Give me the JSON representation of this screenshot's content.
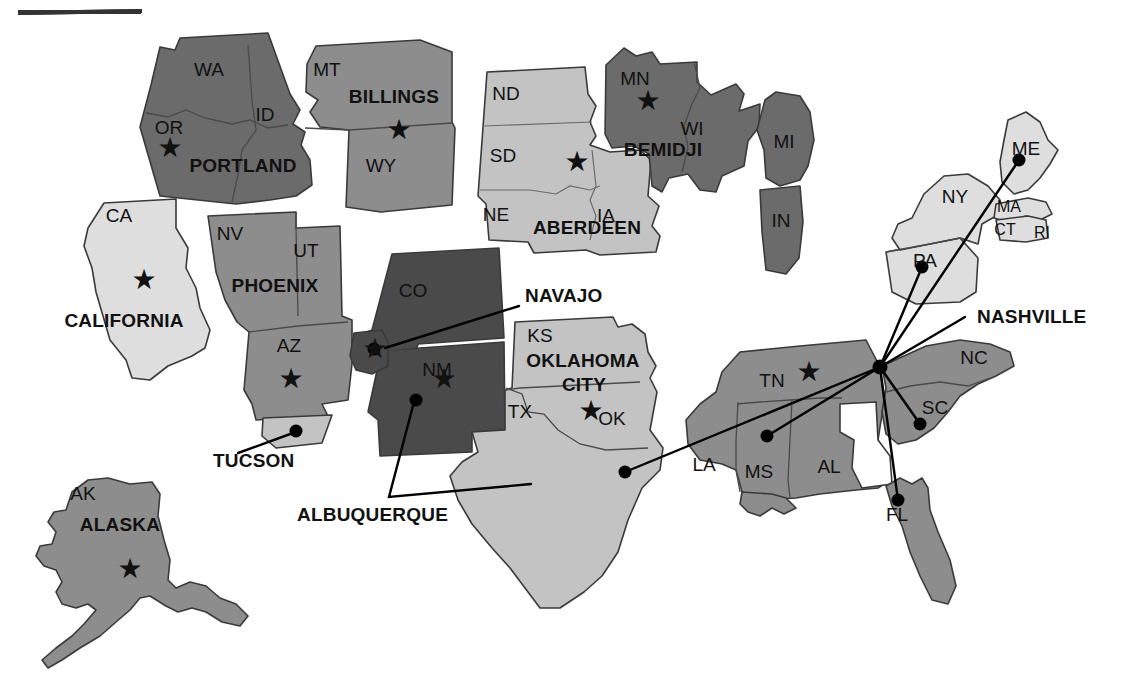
{
  "page": {
    "top_rule": true,
    "ghost_text": ""
  },
  "legend": {
    "star_symbol": "★",
    "star_meaning": "area office",
    "dot_symbol": "●"
  },
  "colors": {
    "darkest": "#4a4a4a",
    "dark": "#6b6b6b",
    "mid": "#8d8d8d",
    "light": "#c3c3c3",
    "lightest": "#dedede",
    "outline": "#3a3a3a",
    "text": "#111111",
    "background": "#ffffff"
  },
  "area_labels": [
    {
      "id": "portland",
      "text": "PORTLAND",
      "x": 243,
      "y": 172
    },
    {
      "id": "billings",
      "text": "BILLINGS",
      "x": 394,
      "y": 103
    },
    {
      "id": "aberdeen",
      "text": "ABERDEEN",
      "x": 587,
      "y": 234
    },
    {
      "id": "bemidji",
      "text": "BEMIDJI",
      "x": 663,
      "y": 156
    },
    {
      "id": "california",
      "text": "CALIFORNIA",
      "x": 124,
      "y": 327
    },
    {
      "id": "phoenix",
      "text": "PHOENIX",
      "x": 275,
      "y": 292
    },
    {
      "id": "oklahoma",
      "text": "OKLAHOMA",
      "x": 583,
      "y": 367
    },
    {
      "id": "oklahoma-city",
      "text": "CITY",
      "x": 584,
      "y": 391
    },
    {
      "id": "alaska",
      "text": "ALASKA",
      "x": 120,
      "y": 531
    }
  ],
  "callouts": [
    {
      "id": "navajo",
      "text": "NAVAJO",
      "label_x": 525,
      "label_y": 302,
      "dot_x": 374,
      "dot_y": 349,
      "path": "M 519 306 L 385 348"
    },
    {
      "id": "tucson",
      "text": "TUCSON",
      "label_x": 213,
      "label_y": 467,
      "dot_x": 296,
      "dot_y": 431,
      "path": "M 238 453 L 293 433"
    },
    {
      "id": "albuquerque",
      "text": "ALBUQUERQUE",
      "label_x": 297,
      "label_y": 521,
      "dot_x": 416,
      "dot_y": 400,
      "path": "M 414 402 L 389 497 L 531 484"
    },
    {
      "id": "nashville",
      "text": "NASHVILLE",
      "label_x": 977,
      "label_y": 323,
      "dot_x": 880,
      "dot_y": 367,
      "path": "M 965 317 L 880 367"
    }
  ],
  "hub": {
    "id": "nashville-hub",
    "x": 880,
    "y": 367
  },
  "hub_spokes": [
    {
      "id": "spoke-maine",
      "to_x": 1019,
      "to_y": 160
    },
    {
      "id": "spoke-pennsylvania",
      "to_x": 922,
      "to_y": 267
    },
    {
      "id": "spoke-south-carolina",
      "to_x": 920,
      "to_y": 424
    },
    {
      "id": "spoke-florida",
      "to_x": 898,
      "to_y": 500
    },
    {
      "id": "spoke-mississippi",
      "to_x": 767,
      "to_y": 436
    },
    {
      "id": "spoke-texas",
      "to_x": 625,
      "to_y": 472
    }
  ],
  "stars": [
    {
      "id": "star-oregon",
      "x": 170,
      "y": 157
    },
    {
      "id": "star-montana",
      "x": 399,
      "y": 139
    },
    {
      "id": "star-south-dakota",
      "x": 577,
      "y": 171
    },
    {
      "id": "star-minnesota",
      "x": 648,
      "y": 110
    },
    {
      "id": "star-california",
      "x": 144,
      "y": 289
    },
    {
      "id": "star-arizona",
      "x": 291,
      "y": 388
    },
    {
      "id": "star-navajo",
      "x": 375,
      "y": 358
    },
    {
      "id": "star-new-mexico",
      "x": 444,
      "y": 388
    },
    {
      "id": "star-oklahoma",
      "x": 591,
      "y": 420
    },
    {
      "id": "star-tennessee",
      "x": 809,
      "y": 381
    },
    {
      "id": "star-alaska",
      "x": 130,
      "y": 578
    }
  ],
  "state_labels": [
    {
      "id": "wa",
      "text": "WA",
      "x": 209,
      "y": 76,
      "size": "lg"
    },
    {
      "id": "or",
      "text": "OR",
      "x": 169,
      "y": 134,
      "size": "lg"
    },
    {
      "id": "id",
      "text": "ID",
      "x": 265,
      "y": 121,
      "size": "lg"
    },
    {
      "id": "mt",
      "text": "MT",
      "x": 327,
      "y": 76,
      "size": "lg"
    },
    {
      "id": "wy",
      "text": "WY",
      "x": 381,
      "y": 172,
      "size": "lg"
    },
    {
      "id": "nd",
      "text": "ND",
      "x": 506,
      "y": 100,
      "size": "lg"
    },
    {
      "id": "sd",
      "text": "SD",
      "x": 503,
      "y": 162,
      "size": "lg"
    },
    {
      "id": "ne",
      "text": "NE",
      "x": 496,
      "y": 221,
      "size": "lg"
    },
    {
      "id": "ia",
      "text": "IA",
      "x": 606,
      "y": 222,
      "size": "lg"
    },
    {
      "id": "mn",
      "text": "MN",
      "x": 635,
      "y": 85,
      "size": "lg"
    },
    {
      "id": "wi",
      "text": "WI",
      "x": 692,
      "y": 135,
      "size": "lg"
    },
    {
      "id": "mi",
      "text": "MI",
      "x": 784,
      "y": 148,
      "size": "lg"
    },
    {
      "id": "in",
      "text": "IN",
      "x": 781,
      "y": 227,
      "size": "lg"
    },
    {
      "id": "ca",
      "text": "CA",
      "x": 119,
      "y": 222,
      "size": "lg"
    },
    {
      "id": "nv",
      "text": "NV",
      "x": 230,
      "y": 240,
      "size": "lg"
    },
    {
      "id": "ut",
      "text": "UT",
      "x": 306,
      "y": 257,
      "size": "lg"
    },
    {
      "id": "az",
      "text": "AZ",
      "x": 289,
      "y": 352,
      "size": "lg"
    },
    {
      "id": "co",
      "text": "CO",
      "x": 413,
      "y": 297,
      "size": "lg"
    },
    {
      "id": "nm",
      "text": "NM",
      "x": 437,
      "y": 376,
      "size": "lg"
    },
    {
      "id": "ks",
      "text": "KS",
      "x": 540,
      "y": 342,
      "size": "lg"
    },
    {
      "id": "ok",
      "text": "OK",
      "x": 612,
      "y": 425,
      "size": "lg"
    },
    {
      "id": "tx",
      "text": "TX",
      "x": 520,
      "y": 418,
      "size": "lg"
    },
    {
      "id": "la",
      "text": "LA",
      "x": 704,
      "y": 471,
      "size": "lg"
    },
    {
      "id": "ms",
      "text": "MS",
      "x": 759,
      "y": 478,
      "size": "lg"
    },
    {
      "id": "al",
      "text": "AL",
      "x": 829,
      "y": 473,
      "size": "lg"
    },
    {
      "id": "fl",
      "text": "FL",
      "x": 897,
      "y": 521,
      "size": "lg"
    },
    {
      "id": "tn",
      "text": "TN",
      "x": 772,
      "y": 387,
      "size": "lg"
    },
    {
      "id": "nc",
      "text": "NC",
      "x": 974,
      "y": 364,
      "size": "lg"
    },
    {
      "id": "sc",
      "text": "SC",
      "x": 935,
      "y": 414,
      "size": "lg"
    },
    {
      "id": "ny",
      "text": "NY",
      "x": 955,
      "y": 203,
      "size": "lg"
    },
    {
      "id": "pa",
      "text": "PA",
      "x": 925,
      "y": 267,
      "size": "lg"
    },
    {
      "id": "me",
      "text": "ME",
      "x": 1026,
      "y": 155,
      "size": "lg"
    },
    {
      "id": "ma",
      "text": "MA",
      "x": 1009,
      "y": 212,
      "size": "sm"
    },
    {
      "id": "ct",
      "text": "CT",
      "x": 1005,
      "y": 235,
      "size": "sm"
    },
    {
      "id": "ri",
      "text": "RI",
      "x": 1042,
      "y": 238,
      "size": "sm"
    },
    {
      "id": "ak",
      "text": "AK",
      "x": 83,
      "y": 500,
      "size": "lg"
    }
  ],
  "regions": [
    {
      "id": "portland-region",
      "name": "Portland Area",
      "shade": "dark",
      "states": [
        "WA",
        "OR",
        "ID"
      ]
    },
    {
      "id": "billings-region",
      "name": "Billings Area",
      "shade": "mid",
      "states": [
        "MT",
        "WY"
      ]
    },
    {
      "id": "aberdeen-region",
      "name": "Aberdeen Area",
      "shade": "light",
      "states": [
        "ND",
        "SD",
        "NE",
        "IA"
      ]
    },
    {
      "id": "bemidji-region",
      "name": "Bemidji Area",
      "shade": "dark",
      "states": [
        "MN",
        "WI",
        "MI",
        "IN"
      ]
    },
    {
      "id": "california-region",
      "name": "California Area",
      "shade": "lightest",
      "states": [
        "CA"
      ]
    },
    {
      "id": "phoenix-region",
      "name": "Phoenix Area",
      "shade": "mid",
      "states": [
        "NV",
        "UT",
        "AZ"
      ]
    },
    {
      "id": "navajo-region",
      "name": "Navajo Area",
      "shade": "darkest",
      "states": [
        "Four Corners"
      ]
    },
    {
      "id": "albuquerque-region",
      "name": "Albuquerque Area",
      "shade": "darkest",
      "states": [
        "CO",
        "NM"
      ]
    },
    {
      "id": "oklahoma-city-region",
      "name": "Oklahoma City Area",
      "shade": "light",
      "states": [
        "KS",
        "OK",
        "TX"
      ]
    },
    {
      "id": "nashville-region",
      "name": "Nashville Area",
      "shade": "mid",
      "states": [
        "TN",
        "NC",
        "SC",
        "AL",
        "MS",
        "LA",
        "FL",
        "PA",
        "NY",
        "ME",
        "MA",
        "CT",
        "RI"
      ]
    },
    {
      "id": "alaska-region",
      "name": "Alaska Area",
      "shade": "mid",
      "states": [
        "AK"
      ]
    }
  ]
}
